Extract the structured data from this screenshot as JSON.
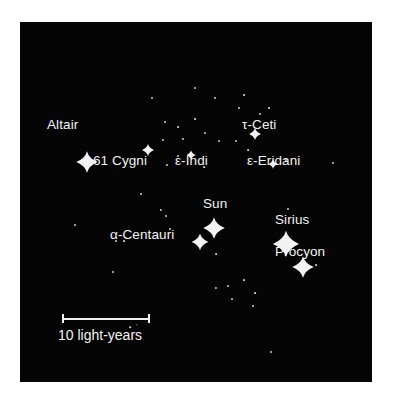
{
  "figure": {
    "type": "star-map",
    "background_color": "#050505",
    "page_color": "#ffffff",
    "star_color": "#f2f2f2",
    "panel": {
      "x": 20,
      "y": 22,
      "width": 352,
      "height": 360
    }
  },
  "chart_data": {
    "type": "scatter",
    "xlabel": "",
    "ylabel": "",
    "grid": false,
    "legend": "none",
    "scale_bar": {
      "label": "10 light-years",
      "length_px": 88,
      "value": 10,
      "unit": "light-years"
    },
    "labeled_stars": [
      {
        "name": "Altair",
        "x": 67,
        "y": 140,
        "size": 9,
        "label_x": 27,
        "label_y": 96,
        "label_align": "left"
      },
      {
        "name": "61 Cygni",
        "x": 128,
        "y": 128,
        "size": 5,
        "label_x": 73,
        "label_y": 132,
        "label_align": "left"
      },
      {
        "name": "ε-Indi",
        "x": 171,
        "y": 133,
        "size": 4,
        "label_x": 155,
        "label_y": 132,
        "label_align": "left"
      },
      {
        "name": "τ-Ceti",
        "x": 235,
        "y": 112,
        "size": 5,
        "label_x": 222,
        "label_y": 96,
        "label_align": "left"
      },
      {
        "name": "ε-Eridani",
        "x": 253,
        "y": 142,
        "size": 4,
        "label_x": 227,
        "label_y": 132,
        "label_align": "left"
      },
      {
        "name": "Sun",
        "x": 194,
        "y": 206,
        "size": 9,
        "label_x": 183,
        "label_y": 175,
        "label_align": "left"
      },
      {
        "name": "Sirius",
        "x": 266,
        "y": 222,
        "size": 11,
        "label_x": 255,
        "label_y": 191,
        "label_align": "left"
      },
      {
        "name": "α-Centauri",
        "x": 180,
        "y": 220,
        "size": 7,
        "label_x": 90,
        "label_y": 206,
        "label_align": "left"
      },
      {
        "name": "Procyon",
        "x": 283,
        "y": 245,
        "size": 9,
        "label_x": 255,
        "label_y": 223,
        "label_align": "left"
      }
    ],
    "field_stars": [
      {
        "x": 132,
        "y": 76,
        "size": 2.0
      },
      {
        "x": 175,
        "y": 66,
        "size": 2.2
      },
      {
        "x": 195,
        "y": 76,
        "size": 2.0
      },
      {
        "x": 219,
        "y": 86,
        "size": 2.2
      },
      {
        "x": 224,
        "y": 73,
        "size": 1.8
      },
      {
        "x": 240,
        "y": 92,
        "size": 2.0
      },
      {
        "x": 249,
        "y": 86,
        "size": 1.8
      },
      {
        "x": 145,
        "y": 100,
        "size": 2.0
      },
      {
        "x": 158,
        "y": 105,
        "size": 1.8
      },
      {
        "x": 163,
        "y": 117,
        "size": 2.0
      },
      {
        "x": 143,
        "y": 118,
        "size": 2.2
      },
      {
        "x": 175,
        "y": 97,
        "size": 1.8
      },
      {
        "x": 185,
        "y": 111,
        "size": 2.0
      },
      {
        "x": 199,
        "y": 119,
        "size": 2.0
      },
      {
        "x": 216,
        "y": 119,
        "size": 2.0
      },
      {
        "x": 228,
        "y": 128,
        "size": 1.8
      },
      {
        "x": 158,
        "y": 134,
        "size": 2.0
      },
      {
        "x": 147,
        "y": 143,
        "size": 2.0
      },
      {
        "x": 184,
        "y": 145,
        "size": 1.8
      },
      {
        "x": 266,
        "y": 138,
        "size": 2.2
      },
      {
        "x": 313,
        "y": 141,
        "size": 2.0
      },
      {
        "x": 268,
        "y": 187,
        "size": 2.0
      },
      {
        "x": 121,
        "y": 172,
        "size": 2.0
      },
      {
        "x": 141,
        "y": 188,
        "size": 2.2
      },
      {
        "x": 55,
        "y": 203,
        "size": 2.0
      },
      {
        "x": 96,
        "y": 219,
        "size": 2.0
      },
      {
        "x": 104,
        "y": 219,
        "size": 1.8
      },
      {
        "x": 146,
        "y": 194,
        "size": 2.0
      },
      {
        "x": 150,
        "y": 207,
        "size": 2.0
      },
      {
        "x": 196,
        "y": 232,
        "size": 1.8
      },
      {
        "x": 93,
        "y": 250,
        "size": 2.0
      },
      {
        "x": 224,
        "y": 258,
        "size": 1.8
      },
      {
        "x": 235,
        "y": 271,
        "size": 1.8
      },
      {
        "x": 196,
        "y": 266,
        "size": 2.2
      },
      {
        "x": 208,
        "y": 264,
        "size": 2.0
      },
      {
        "x": 212,
        "y": 277,
        "size": 2.0
      },
      {
        "x": 233,
        "y": 284,
        "size": 2.0
      },
      {
        "x": 296,
        "y": 243,
        "size": 1.8
      },
      {
        "x": 251,
        "y": 330,
        "size": 2.0
      },
      {
        "x": 110,
        "y": 305,
        "size": 1.6
      },
      {
        "x": 117,
        "y": 303,
        "size": 1.4
      }
    ]
  }
}
